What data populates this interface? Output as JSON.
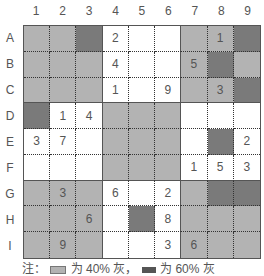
{
  "columns": [
    "1",
    "2",
    "3",
    "4",
    "5",
    "6",
    "7",
    "8",
    "9"
  ],
  "rows": [
    "A",
    "B",
    "C",
    "D",
    "E",
    "F",
    "G",
    "H",
    "I"
  ],
  "colors": {
    "white": "#ffffff",
    "light_gray": "#b3b3b3",
    "dark_gray": "#7a7a7a"
  },
  "grid": [
    [
      {
        "s": "L",
        "v": ""
      },
      {
        "s": "L",
        "v": ""
      },
      {
        "s": "D",
        "v": ""
      },
      {
        "s": "W",
        "v": "2"
      },
      {
        "s": "W",
        "v": ""
      },
      {
        "s": "W",
        "v": ""
      },
      {
        "s": "L",
        "v": ""
      },
      {
        "s": "L",
        "v": "1"
      },
      {
        "s": "D",
        "v": ""
      }
    ],
    [
      {
        "s": "L",
        "v": ""
      },
      {
        "s": "L",
        "v": ""
      },
      {
        "s": "L",
        "v": ""
      },
      {
        "s": "W",
        "v": "4"
      },
      {
        "s": "W",
        "v": ""
      },
      {
        "s": "W",
        "v": ""
      },
      {
        "s": "L",
        "v": "5"
      },
      {
        "s": "D",
        "v": ""
      },
      {
        "s": "L",
        "v": ""
      }
    ],
    [
      {
        "s": "L",
        "v": ""
      },
      {
        "s": "L",
        "v": ""
      },
      {
        "s": "L",
        "v": ""
      },
      {
        "s": "W",
        "v": "1"
      },
      {
        "s": "W",
        "v": ""
      },
      {
        "s": "W",
        "v": "9"
      },
      {
        "s": "L",
        "v": ""
      },
      {
        "s": "L",
        "v": "3"
      },
      {
        "s": "D",
        "v": ""
      }
    ],
    [
      {
        "s": "D",
        "v": ""
      },
      {
        "s": "W",
        "v": "1"
      },
      {
        "s": "W",
        "v": "4"
      },
      {
        "s": "L",
        "v": ""
      },
      {
        "s": "L",
        "v": ""
      },
      {
        "s": "L",
        "v": ""
      },
      {
        "s": "W",
        "v": ""
      },
      {
        "s": "W",
        "v": ""
      },
      {
        "s": "W",
        "v": ""
      }
    ],
    [
      {
        "s": "W",
        "v": "3"
      },
      {
        "s": "W",
        "v": "7"
      },
      {
        "s": "W",
        "v": ""
      },
      {
        "s": "L",
        "v": ""
      },
      {
        "s": "L",
        "v": ""
      },
      {
        "s": "L",
        "v": ""
      },
      {
        "s": "W",
        "v": ""
      },
      {
        "s": "D",
        "v": ""
      },
      {
        "s": "W",
        "v": "2"
      }
    ],
    [
      {
        "s": "W",
        "v": ""
      },
      {
        "s": "W",
        "v": ""
      },
      {
        "s": "W",
        "v": ""
      },
      {
        "s": "L",
        "v": ""
      },
      {
        "s": "L",
        "v": ""
      },
      {
        "s": "L",
        "v": ""
      },
      {
        "s": "W",
        "v": "1"
      },
      {
        "s": "W",
        "v": "5"
      },
      {
        "s": "W",
        "v": "3"
      }
    ],
    [
      {
        "s": "L",
        "v": ""
      },
      {
        "s": "L",
        "v": "3"
      },
      {
        "s": "L",
        "v": ""
      },
      {
        "s": "W",
        "v": "6"
      },
      {
        "s": "W",
        "v": ""
      },
      {
        "s": "W",
        "v": "2"
      },
      {
        "s": "L",
        "v": ""
      },
      {
        "s": "D",
        "v": ""
      },
      {
        "s": "D",
        "v": ""
      }
    ],
    [
      {
        "s": "L",
        "v": ""
      },
      {
        "s": "L",
        "v": ""
      },
      {
        "s": "L",
        "v": "6"
      },
      {
        "s": "W",
        "v": ""
      },
      {
        "s": "D",
        "v": ""
      },
      {
        "s": "W",
        "v": "8"
      },
      {
        "s": "L",
        "v": ""
      },
      {
        "s": "L",
        "v": ""
      },
      {
        "s": "L",
        "v": ""
      }
    ],
    [
      {
        "s": "L",
        "v": ""
      },
      {
        "s": "L",
        "v": "9"
      },
      {
        "s": "L",
        "v": ""
      },
      {
        "s": "W",
        "v": ""
      },
      {
        "s": "W",
        "v": ""
      },
      {
        "s": "W",
        "v": "3"
      },
      {
        "s": "L",
        "v": "6"
      },
      {
        "s": "L",
        "v": ""
      },
      {
        "s": "L",
        "v": ""
      }
    ]
  ],
  "legend": {
    "prefix": "注：",
    "light_text": "为 40% 灰，",
    "dark_text": "为 60% 灰"
  }
}
